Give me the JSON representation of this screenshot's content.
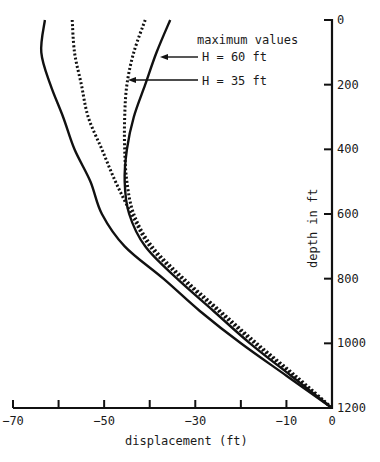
{
  "chart_data": {
    "type": "line",
    "title": "",
    "xlabel": "displacement (ft)",
    "ylabel": "depth in ft",
    "xlim": [
      -70,
      0
    ],
    "ylim": [
      0,
      1200
    ],
    "y_inverted": true,
    "grid": false,
    "x_ticks": [
      -70,
      -60,
      -50,
      -40,
      -30,
      -20,
      -10,
      0
    ],
    "x_tick_labels": [
      "-70",
      "",
      "-50",
      "",
      "-30",
      "",
      "-10",
      "0"
    ],
    "y_ticks": [
      0,
      200,
      400,
      600,
      800,
      1000,
      1200
    ],
    "y_tick_labels": [
      "0",
      "200",
      "400",
      "600",
      "800",
      "1000",
      "1200"
    ],
    "annotations": [
      {
        "text": "maximum values",
        "x": -29.5,
        "y": 62
      },
      {
        "text": "H = 60 ft",
        "arrow_to_series": "H = 60 ft",
        "arrow_depth": 110
      },
      {
        "text": "H = 35 ft",
        "arrow_to_series": "H = 35 ft",
        "arrow_depth": 180
      }
    ],
    "series": [
      {
        "name": "maximum values (H = 60 ft)",
        "style": "solid",
        "depth": [
          0,
          100,
          200,
          300,
          400,
          500,
          600,
          700,
          800,
          900,
          1000,
          1100,
          1200
        ],
        "displacement": [
          -63,
          -63.8,
          -61.8,
          -59,
          -56.5,
          -53,
          -50.5,
          -45.5,
          -37,
          -29,
          -20,
          -10,
          0
        ]
      },
      {
        "name": "maximum values (H = 35 ft)",
        "style": "dotted",
        "depth": [
          0,
          100,
          200,
          300,
          400,
          500,
          600,
          700,
          800,
          900,
          1000,
          1100,
          1200
        ],
        "displacement": [
          -57,
          -56.5,
          -55,
          -53.5,
          -50.5,
          -47.5,
          -44,
          -40,
          -33,
          -25,
          -17,
          -8.5,
          0
        ]
      },
      {
        "name": "H = 60 ft",
        "style": "solid",
        "depth": [
          0,
          100,
          200,
          300,
          400,
          500,
          600,
          700,
          800,
          900,
          1000,
          1100,
          1200
        ],
        "displacement": [
          -35.5,
          -38.5,
          -41,
          -43.5,
          -45,
          -45.5,
          -44.5,
          -41,
          -34,
          -26,
          -18,
          -9,
          0
        ]
      },
      {
        "name": "H = 35 ft",
        "style": "dotted",
        "depth": [
          0,
          100,
          200,
          300,
          400,
          500,
          600,
          700,
          800,
          900,
          1000,
          1100,
          1200
        ],
        "displacement": [
          -41,
          -43.5,
          -45,
          -45.5,
          -45.5,
          -45,
          -43.5,
          -39.5,
          -32.5,
          -24.5,
          -16.5,
          -8,
          0
        ]
      }
    ]
  },
  "legend": {
    "heading": "maximum values",
    "h60": "H = 60 ft",
    "h35": "H = 35 ft"
  },
  "axes": {
    "xlabel": "displacement (ft)",
    "ylabel": "depth in ft"
  },
  "colors": {
    "line": "#111111",
    "background": "#ffffff"
  }
}
